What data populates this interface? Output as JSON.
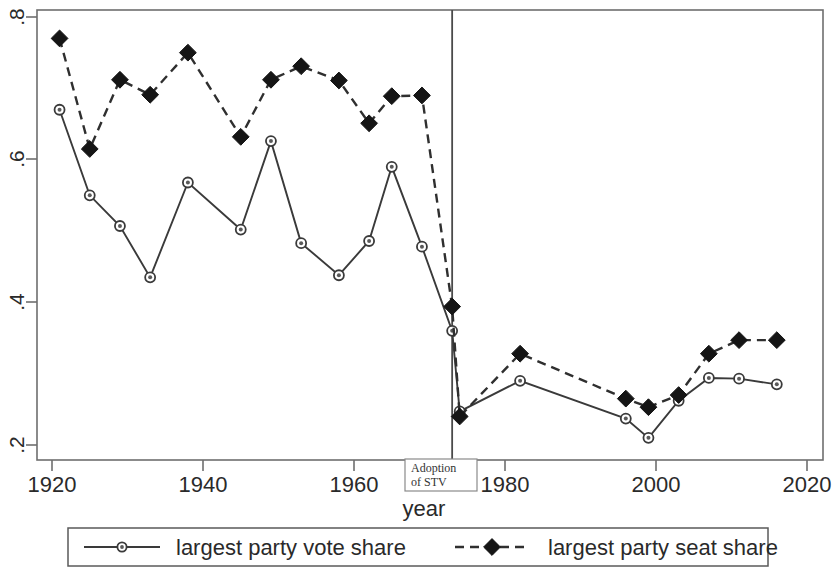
{
  "chart_data": {
    "type": "line",
    "title": "",
    "xlabel": "year",
    "ylabel": "",
    "xlim": [
      1918,
      2018
    ],
    "ylim": [
      0.168,
      0.828
    ],
    "grid": false,
    "legend_position": "bottom",
    "x_ticks": [
      1920,
      1940,
      1960,
      1980,
      2000,
      2020
    ],
    "x_tick_labels": [
      "1920",
      "1940",
      "1960",
      "1980",
      "2000",
      "2020"
    ],
    "y_ticks": [
      0.2,
      0.4,
      0.6,
      0.8
    ],
    "y_tick_labels": [
      ".2",
      ".4",
      ".6",
      ".8"
    ],
    "annotations": [
      {
        "name": "adoption-of-stv",
        "line1": "Adoption",
        "line2": "of STV",
        "x": 1973,
        "type": "vertical-line-with-label"
      }
    ],
    "series": [
      {
        "name": "largest party vote share",
        "marker": "circle-open",
        "linestyle": "solid",
        "color": "#3a3a3a",
        "x": [
          1921,
          1925,
          1929,
          1933,
          1938,
          1945,
          1949,
          1953,
          1958,
          1962,
          1965,
          1969,
          1973,
          1974,
          1982,
          1996,
          1999,
          2003,
          2007,
          2011,
          2016
        ],
        "y": [
          0.67,
          0.55,
          0.507,
          0.435,
          0.568,
          0.502,
          0.626,
          0.483,
          0.438,
          0.486,
          0.59,
          0.478,
          0.36,
          0.247,
          0.29,
          0.237,
          0.21,
          0.262,
          0.294,
          0.293,
          0.285
        ]
      },
      {
        "name": "largest party seat share",
        "marker": "diamond-filled",
        "linestyle": "dashed",
        "color": "#151515",
        "x": [
          1921,
          1925,
          1929,
          1933,
          1938,
          1945,
          1949,
          1953,
          1958,
          1962,
          1965,
          1969,
          1973,
          1974,
          1982,
          1996,
          1999,
          2003,
          2007,
          2011,
          2016
        ],
        "y": [
          0.77,
          0.615,
          0.712,
          0.691,
          0.75,
          0.632,
          0.712,
          0.731,
          0.711,
          0.651,
          0.689,
          0.69,
          0.394,
          0.24,
          0.328,
          0.265,
          0.253,
          0.27,
          0.328,
          0.347,
          0.347
        ]
      }
    ]
  },
  "legend": {
    "items": [
      {
        "label": "largest party vote share",
        "marker": "circle-open",
        "style": "solid"
      },
      {
        "label": "largest party seat share",
        "marker": "diamond-filled",
        "style": "dashed"
      }
    ]
  },
  "axis": {
    "x_title": "year"
  }
}
